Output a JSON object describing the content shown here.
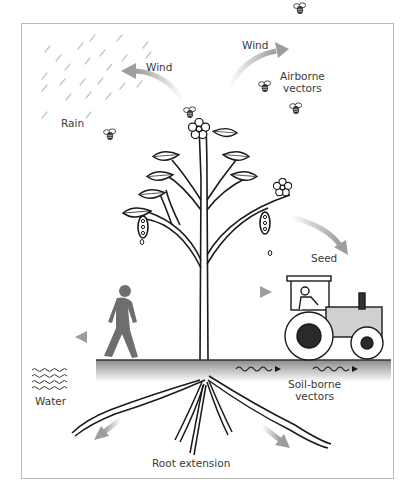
{
  "diagram": {
    "type": "pathogen-dispersal-illustration",
    "labels": {
      "wind_left": "Wind",
      "wind_right": "Wind",
      "rain": "Rain",
      "airborne_line1": "Airborne",
      "airborne_line2": "vectors",
      "seed": "Seed",
      "water": "Water",
      "soilborne_line1": "Soil-borne",
      "soilborne_line2": "vectors",
      "root_extension": "Root extension"
    },
    "elements": [
      "rain",
      "wind-arrows",
      "insects",
      "plant",
      "flowers",
      "seed-pods",
      "walking-person",
      "tractor",
      "ground",
      "water-waves",
      "roots",
      "dispersal-arrows"
    ],
    "colors": {
      "ink": "#1a1a1a",
      "arrow_gray": "#a8a8a8",
      "silhouette": "#6e6e6e",
      "ground_top": "#8c8c8c",
      "frame": "#b9b9b9"
    }
  }
}
